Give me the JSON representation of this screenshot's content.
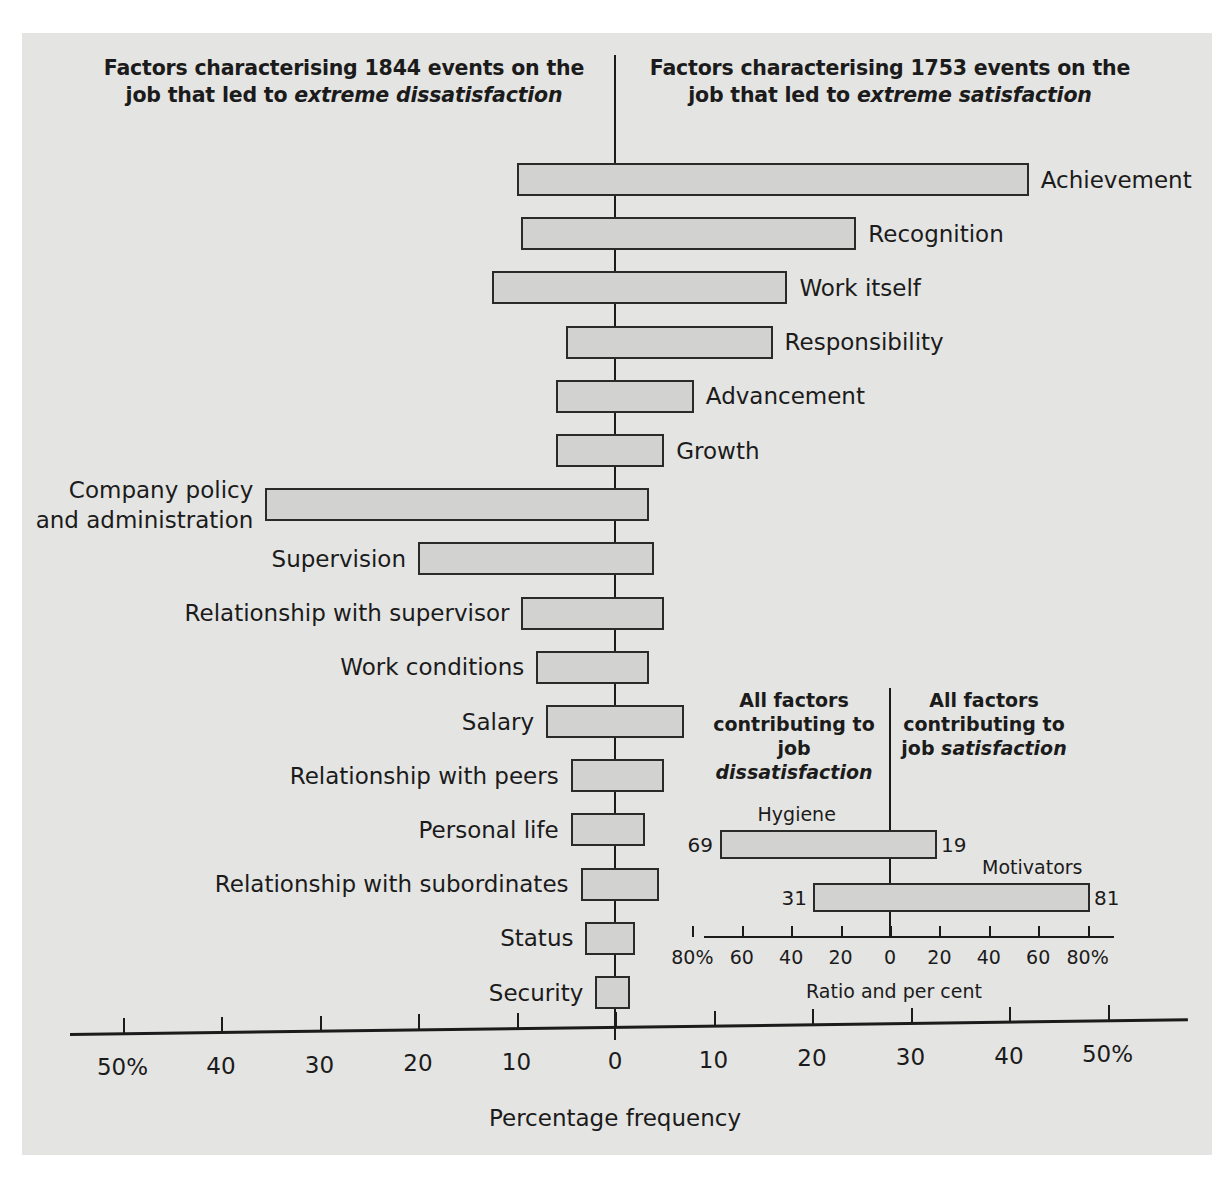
{
  "titles": {
    "left_line1": "Factors characterising 1844 events on the",
    "left_line2_pre": "job that led to ",
    "left_line2_em": "extreme dissatisfaction",
    "right_line1": "Factors characterising 1753 events on the",
    "right_line2_pre": "job that led to ",
    "right_line2_em": "extreme satisfaction"
  },
  "axis": {
    "caption": "Percentage frequency",
    "tick_labels": [
      "50%",
      "40",
      "30",
      "20",
      "10",
      "0",
      "10",
      "20",
      "30",
      "40",
      "50%"
    ],
    "tick_values": [
      -50,
      -40,
      -30,
      -20,
      -10,
      0,
      10,
      20,
      30,
      40,
      50
    ]
  },
  "inset": {
    "title_left_line1": "All factors",
    "title_left_line2": "contributing to",
    "title_left_line3_pre": "job ",
    "title_left_line3_em": "dissatisfaction",
    "title_right_line1": "All factors",
    "title_right_line2": "contributing to",
    "title_right_line3_pre": "job ",
    "title_right_line3_em": "satisfaction",
    "caption": "Ratio and per cent",
    "tick_labels": [
      "80%",
      "60",
      "40",
      "20",
      "0",
      "20",
      "40",
      "60",
      "80%"
    ],
    "tick_values": [
      -80,
      -60,
      -40,
      -20,
      0,
      20,
      40,
      60,
      80
    ]
  },
  "chart_data": {
    "type": "bar",
    "orientation": "horizontal",
    "style": "diverging-bidirectional",
    "xlabel": "Percentage frequency",
    "ylabel": "",
    "xlim": [
      -50,
      50
    ],
    "grid": false,
    "legend_position": "none",
    "left_side_label": "Factors characterising 1844 events on the job that led to extreme dissatisfaction",
    "right_side_label": "Factors characterising 1753 events on the job that led to extreme satisfaction",
    "series": [
      {
        "name": "extreme dissatisfaction",
        "side": "left"
      },
      {
        "name": "extreme satisfaction",
        "side": "right"
      }
    ],
    "categories": [
      "Achievement",
      "Recognition",
      "Work itself",
      "Responsibility",
      "Advancement",
      "Growth",
      "Company policy and administration",
      "Supervision",
      "Relationship with supervisor",
      "Work conditions",
      "Salary",
      "Relationship with peers",
      "Personal life",
      "Relationship with subordinates",
      "Status",
      "Security"
    ],
    "bars": [
      {
        "category": "Achievement",
        "group": "motivator",
        "label_side": "right",
        "dissatisfaction": 10.0,
        "satisfaction": 42.0
      },
      {
        "category": "Recognition",
        "group": "motivator",
        "label_side": "right",
        "dissatisfaction": 9.5,
        "satisfaction": 24.5
      },
      {
        "category": "Work itself",
        "group": "motivator",
        "label_side": "right",
        "dissatisfaction": 12.5,
        "satisfaction": 17.5
      },
      {
        "category": "Responsibility",
        "group": "motivator",
        "label_side": "right",
        "dissatisfaction": 5.0,
        "satisfaction": 16.0
      },
      {
        "category": "Advancement",
        "group": "motivator",
        "label_side": "right",
        "dissatisfaction": 6.0,
        "satisfaction": 8.0
      },
      {
        "category": "Growth",
        "group": "motivator",
        "label_side": "right",
        "dissatisfaction": 6.0,
        "satisfaction": 5.0
      },
      {
        "category": "Company policy and administration",
        "group": "hygiene",
        "label_side": "left",
        "dissatisfaction": 35.5,
        "satisfaction": 3.5
      },
      {
        "category": "Supervision",
        "group": "hygiene",
        "label_side": "left",
        "dissatisfaction": 20.0,
        "satisfaction": 4.0
      },
      {
        "category": "Relationship with supervisor",
        "group": "hygiene",
        "label_side": "left",
        "dissatisfaction": 9.5,
        "satisfaction": 5.0
      },
      {
        "category": "Work conditions",
        "group": "hygiene",
        "label_side": "left",
        "dissatisfaction": 8.0,
        "satisfaction": 3.5
      },
      {
        "category": "Salary",
        "group": "hygiene",
        "label_side": "left",
        "dissatisfaction": 7.0,
        "satisfaction": 7.0
      },
      {
        "category": "Relationship with peers",
        "group": "hygiene",
        "label_side": "left",
        "dissatisfaction": 4.5,
        "satisfaction": 5.0
      },
      {
        "category": "Personal life",
        "group": "hygiene",
        "label_side": "left",
        "dissatisfaction": 4.5,
        "satisfaction": 3.0
      },
      {
        "category": "Relationship with subordinates",
        "group": "hygiene",
        "label_side": "left",
        "dissatisfaction": 3.5,
        "satisfaction": 4.5
      },
      {
        "category": "Status",
        "group": "hygiene",
        "label_side": "left",
        "dissatisfaction": 3.0,
        "satisfaction": 2.0
      },
      {
        "category": "Security",
        "group": "hygiene",
        "label_side": "left",
        "dissatisfaction": 2.0,
        "satisfaction": 1.5
      }
    ],
    "inset_chart": {
      "type": "bar",
      "orientation": "horizontal",
      "style": "diverging-bidirectional",
      "xlabel": "Ratio and per cent",
      "xlim": [
        -80,
        80
      ],
      "categories": [
        "Hygiene",
        "Motivators"
      ],
      "bars": [
        {
          "category": "Hygiene",
          "dissatisfaction": 69,
          "satisfaction": 19,
          "label_left": "69",
          "label_right": "19"
        },
        {
          "category": "Motivators",
          "dissatisfaction": 31,
          "satisfaction": 81,
          "label_left": "31",
          "label_right": "81"
        }
      ]
    }
  },
  "colors": {
    "background": "#e4e4e2",
    "bar_fill": "#d2d2d0",
    "bar_stroke": "#2a2a2a",
    "text": "#1b1b1b"
  }
}
